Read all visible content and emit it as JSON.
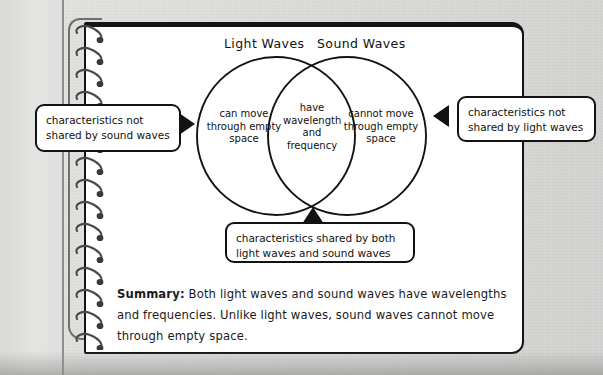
{
  "diagram": {
    "kind": "venn-diagram",
    "circle_titles": {
      "left": "Light Waves",
      "right": "Sound Waves"
    },
    "regions": {
      "left_only": "can move through empty space",
      "overlap": "have wavelength and frequency",
      "right_only": "cannot move through empty space"
    }
  },
  "callouts": {
    "left": "characteristics not shared by sound waves",
    "right": "characteristics not shared by light waves",
    "bottom": "characteristics shared by both light waves and sound waves"
  },
  "summary": {
    "label": "Summary:",
    "text": " Both light waves and sound waves have wavelengths and frequencies. Unlike light waves, sound waves cannot move through empty space."
  },
  "colors": {
    "ink": "#121212",
    "page": "#ffffff",
    "background": "#dcdcda",
    "ring": "#6f6f6d"
  }
}
